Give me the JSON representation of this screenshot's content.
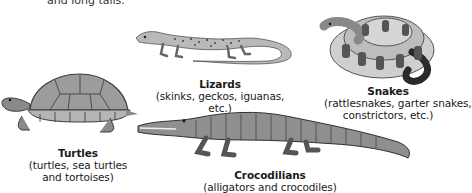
{
  "intro": {
    "partial_text": "and long tails."
  },
  "groups": [
    {
      "id": "lizards",
      "title": "Lizards",
      "examples": "(skinks, geckos, iguanas, etc.)"
    },
    {
      "id": "snakes",
      "title": "Snakes",
      "examples_line1": "(rattlesnakes, garter snakes,",
      "examples_line2": "constrictors, etc.)"
    },
    {
      "id": "turtles",
      "title": "Turtles",
      "examples_line1": "(turtles, sea turtles",
      "examples_line2": "and tortoises)"
    },
    {
      "id": "crocodilians",
      "title": "Crocodilians",
      "examples": "(alligators and crocodiles)"
    }
  ],
  "illustrations": {
    "lizard": "lizard-illustration",
    "snake": "coiled-snake-illustration",
    "turtle": "turtle-illustration",
    "crocodile": "crocodile-illustration"
  },
  "colors": {
    "background": "#ffffff",
    "text": "#1a1a1a",
    "ink_dark": "#3a3a3a",
    "ink_mid": "#8a8a8a",
    "ink_light": "#c8c8c8"
  }
}
